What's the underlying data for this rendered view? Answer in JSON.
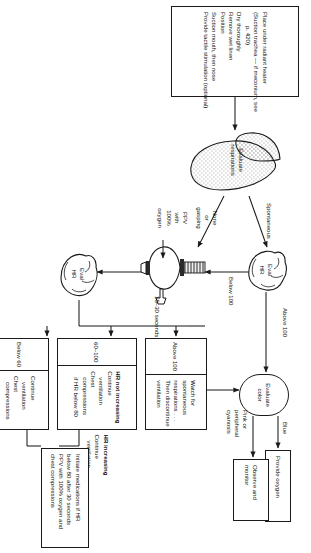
{
  "meta": {
    "orientation": "rotated-90",
    "ink": "#1a1a1a",
    "paper": "#ffffff"
  },
  "initial_steps": {
    "name": "initial-steps",
    "lines": [
      "Place under radiant heater",
      "(Suction trachea — if meconium, see",
      "p. 420)",
      "Dry thoroughly",
      "Remove wet linen",
      "Position",
      "Suction mouth, then nose",
      "Provide tactile stimulation (optional)"
    ]
  },
  "evaluate_respirations": {
    "name": "evaluate-respirations",
    "line1": "Evaluate",
    "line2": "respirations"
  },
  "eval_hr_top": {
    "name": "eval-hr-top",
    "line1": "Eval",
    "line2": "HR"
  },
  "eval_hr_bottom": {
    "name": "eval-hr-bottom",
    "line1": "Eval",
    "line2": "HR"
  },
  "ppv_device": {
    "name": "ppv-bag-and-mask",
    "label_lines": [
      "PPV",
      "with",
      "100%",
      "oxygen"
    ],
    "timing": "15–30 seconds"
  },
  "evaluate_color": {
    "name": "evaluate-color",
    "line1": "Evaluate",
    "line2": "color"
  },
  "edge_labels": {
    "spontaneous": "Spontaneous",
    "none_or_gasping": [
      "None",
      "or",
      "gasping"
    ],
    "below_100": "Below 100",
    "above_100_top": "Above 100",
    "blue": "Blue",
    "pink_cyanosis": [
      "Pink or",
      "peripheral",
      "cyanosis"
    ]
  },
  "provide_oxygen": {
    "name": "provide-oxygen",
    "lines": [
      "Provide oxygen"
    ]
  },
  "observe_monitor": {
    "name": "observe-and-monitor",
    "lines": [
      "Observe and",
      "monitor"
    ]
  },
  "above_100_box": {
    "name": "hr-above-100-outcome",
    "header": "Above 100",
    "lines": [
      "Watch for",
      "spontaneous",
      "respirations . . .",
      "Then discontinue",
      "ventilation"
    ]
  },
  "range_60_100_box": {
    "name": "hr-60-to-100-outcome",
    "header": "60–100",
    "columns": [
      {
        "title": "HR not increasing",
        "lines": [
          "Continue",
          "ventilation",
          "Chest",
          "compressions",
          "if HR below 80"
        ]
      },
      {
        "title": "HR increasing",
        "lines": [
          "Continue",
          "ventilation"
        ]
      }
    ]
  },
  "below_60_box": {
    "name": "hr-below-60-outcome",
    "header": "Below 60",
    "lines": [
      "Continue",
      "ventilation",
      "Chest",
      "compressions"
    ]
  },
  "medications_box": {
    "name": "initiate-medications",
    "lines": [
      "Initiate medications if HR",
      "below 80 after 30 seconds",
      "PPV with 100% oxygen and",
      "chest compressions"
    ]
  }
}
